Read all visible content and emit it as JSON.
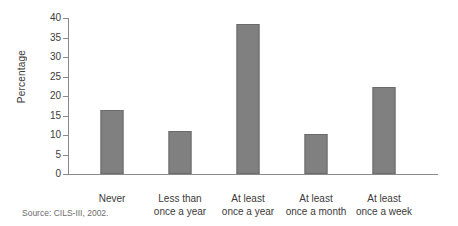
{
  "chart_data": {
    "type": "bar",
    "title": "",
    "subtitle": "",
    "xlabel": "",
    "ylabel": "Percentage",
    "ylim": [
      0,
      40
    ],
    "yticks": [
      0,
      5,
      10,
      15,
      20,
      25,
      30,
      35,
      40
    ],
    "grid": false,
    "legend": false,
    "legend_position": "none",
    "categories": [
      "Never",
      "Less than once a year",
      "At least once a year",
      "At least once a month",
      "At least once a week"
    ],
    "category_label_lines": [
      [
        "Never",
        ""
      ],
      [
        "Less than",
        "once a year"
      ],
      [
        "At least",
        "once a year"
      ],
      [
        "At least",
        "once a month"
      ],
      [
        "At least",
        "once a week"
      ]
    ],
    "values": [
      16.5,
      11.0,
      38.5,
      10.3,
      22.2
    ],
    "bar_color": "#808080",
    "bar_border_color": "#6b6b6b",
    "axis_color": "#8a8a8a",
    "text_color": "#3b3b3b",
    "background_color": "#ffffff"
  },
  "source": {
    "note": "Source: CILS-III, 2002."
  }
}
